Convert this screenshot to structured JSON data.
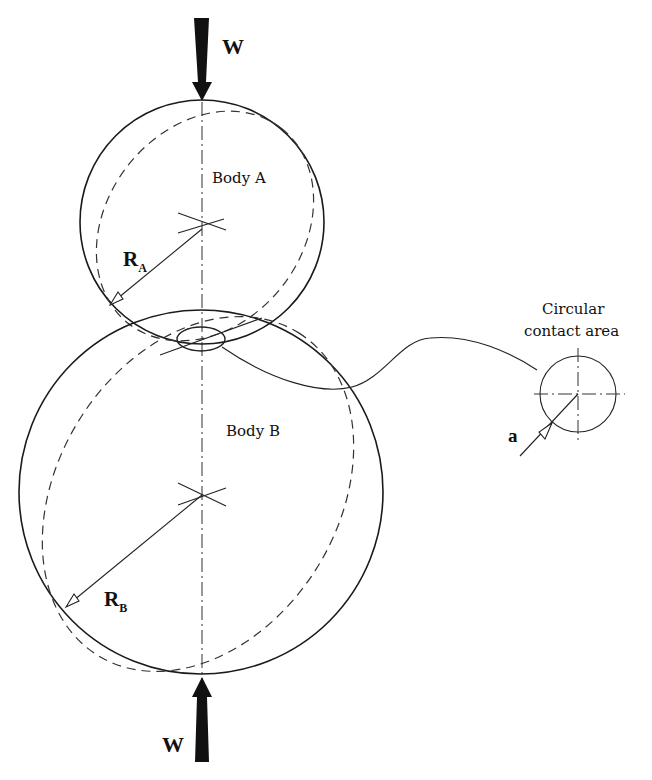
{
  "figure": {
    "type": "Hertzian contact between two spheres",
    "load_top": {
      "label": "W",
      "direction": "down"
    },
    "load_bottom": {
      "label": "W",
      "direction": "up"
    },
    "body_a": {
      "label": "Body A",
      "radius_label": "R",
      "radius_subscript": "A"
    },
    "body_b": {
      "label": "Body B",
      "radius_label": "R",
      "radius_subscript": "B"
    },
    "contact_detail": {
      "title_line1": "Circular",
      "title_line2": "contact area",
      "radius_label": "a"
    }
  }
}
